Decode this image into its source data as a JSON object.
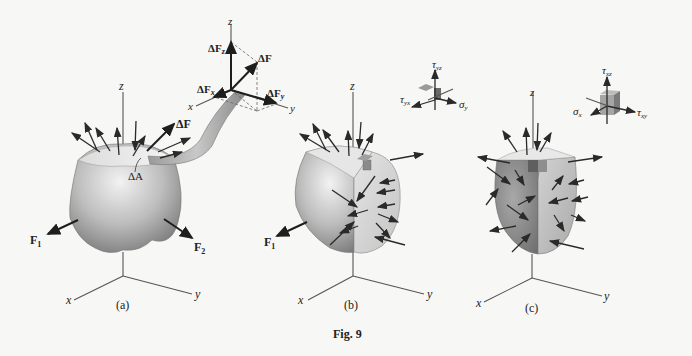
{
  "figure": {
    "caption": "Fig. 9",
    "panels": [
      {
        "id": "a",
        "label": "(a)",
        "axes": {
          "x": "x",
          "y": "y",
          "z": "z"
        },
        "forces": [
          "F1",
          "F2"
        ],
        "annotations": {
          "delta_A": "ΔA",
          "delta_F": "ΔF"
        }
      },
      {
        "id": "b",
        "label": "(b)",
        "axes": {
          "x": "x",
          "y": "y",
          "z": "z"
        },
        "forces": [
          "F1"
        ],
        "stress_element": {
          "labels": [
            "τyz",
            "τyx",
            "σy"
          ]
        }
      },
      {
        "id": "c",
        "label": "(c)",
        "axes": {
          "x": "x",
          "y": "y",
          "z": "z"
        },
        "stress_element": {
          "labels": [
            "τxz",
            "σx",
            "τxy"
          ]
        }
      }
    ],
    "force_components": {
      "axes": {
        "x": "x",
        "y": "y",
        "z": "z"
      },
      "labels": {
        "dF": "ΔF",
        "dFx": "ΔF",
        "dFx_sub": "x",
        "dFy": "ΔF",
        "dFy_sub": "y",
        "dFz": "ΔF",
        "dFz_sub": "z"
      }
    },
    "text": {
      "F": "F",
      "sub1": "1",
      "sub2": "2",
      "tau": "τ",
      "sigma": "σ",
      "yz": "yz",
      "yx": "yx",
      "y": "y",
      "xz": "xz",
      "x": "x",
      "xy": "xy",
      "dA": "ΔA",
      "dF": "ΔF"
    }
  }
}
